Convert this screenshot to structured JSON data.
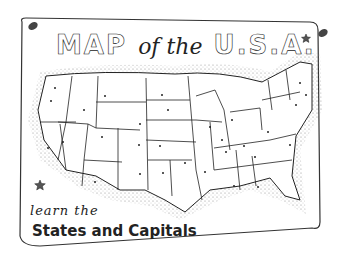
{
  "poster": {
    "title_part1": "MAP",
    "title_part2": "of the",
    "title_part3": "U.S.A.",
    "subtitle_line1": "learn the",
    "subtitle_line2": "States and Capitals"
  },
  "icons": [
    "pushpin-icon",
    "pushpin-icon",
    "star-icon",
    "star-icon"
  ],
  "colors": {
    "ink": "#222222",
    "paper": "#ffffff",
    "stipple": "#888888"
  }
}
